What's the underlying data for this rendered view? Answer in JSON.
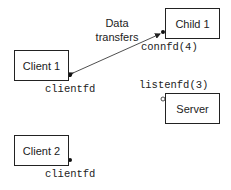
{
  "diagram": {
    "nodes": {
      "child1": {
        "label": "Child 1",
        "descriptor": "connfd(4)"
      },
      "client1": {
        "label": "Client 1",
        "descriptor": "clientfd"
      },
      "server": {
        "label": "Server",
        "descriptor": "listenfd(3)"
      },
      "client2": {
        "label": "Client 2",
        "descriptor": "clientfd"
      }
    },
    "edges": [
      {
        "from": "client1",
        "to": "child1",
        "type": "bidirectional-arrow",
        "label_line1": "Data",
        "label_line2": "transfers"
      }
    ],
    "colors": {
      "stroke": "#222222",
      "background": "#ffffff"
    }
  }
}
